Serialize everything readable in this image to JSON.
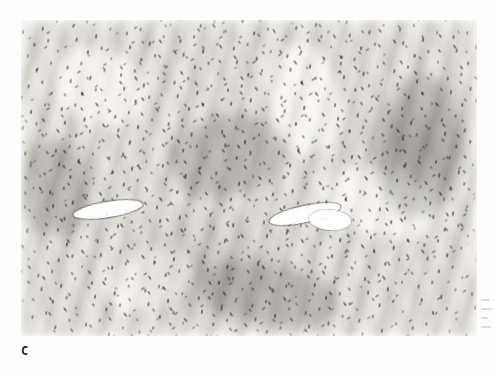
{
  "figure": {
    "panel_label": "C",
    "caption_text": "",
    "modality": "light-microscopy-histopathology",
    "stain": "hematoxylin-and-eosin",
    "color_mode": "grayscale"
  },
  "micrograph": {
    "alt_description": "Grayscale photomicrograph of a densely cellular spindle cell neoplasm arranged in interlacing fascicles with hyperchromatic elongated nuclei and slit-like vascular spaces",
    "frame": {
      "left_px": 21,
      "top_px": 20,
      "width_px": 456,
      "height_px": 316
    },
    "features": [
      {
        "name": "vessel-left",
        "description": "slit-like vascular space",
        "left_px": 52,
        "top_px": 182
      },
      {
        "name": "vessel-center",
        "description": "slit-like vascular space",
        "left_px": 248,
        "top_px": 186
      },
      {
        "name": "vessel-center-2",
        "description": "dilated vascular lumen",
        "left_px": 288,
        "top_px": 190
      }
    ]
  },
  "colors": {
    "page_background": "#ffffff",
    "tissue_base": "#dedcd8",
    "nuclei_dark": "#1b1918",
    "pale_stroma": "#f2f1ee",
    "label_text": "#1b1b1b",
    "artifact_gray": "#8c8c8c"
  },
  "margin": {
    "artifact_note": "faint bleed-through marks at right page edge"
  }
}
